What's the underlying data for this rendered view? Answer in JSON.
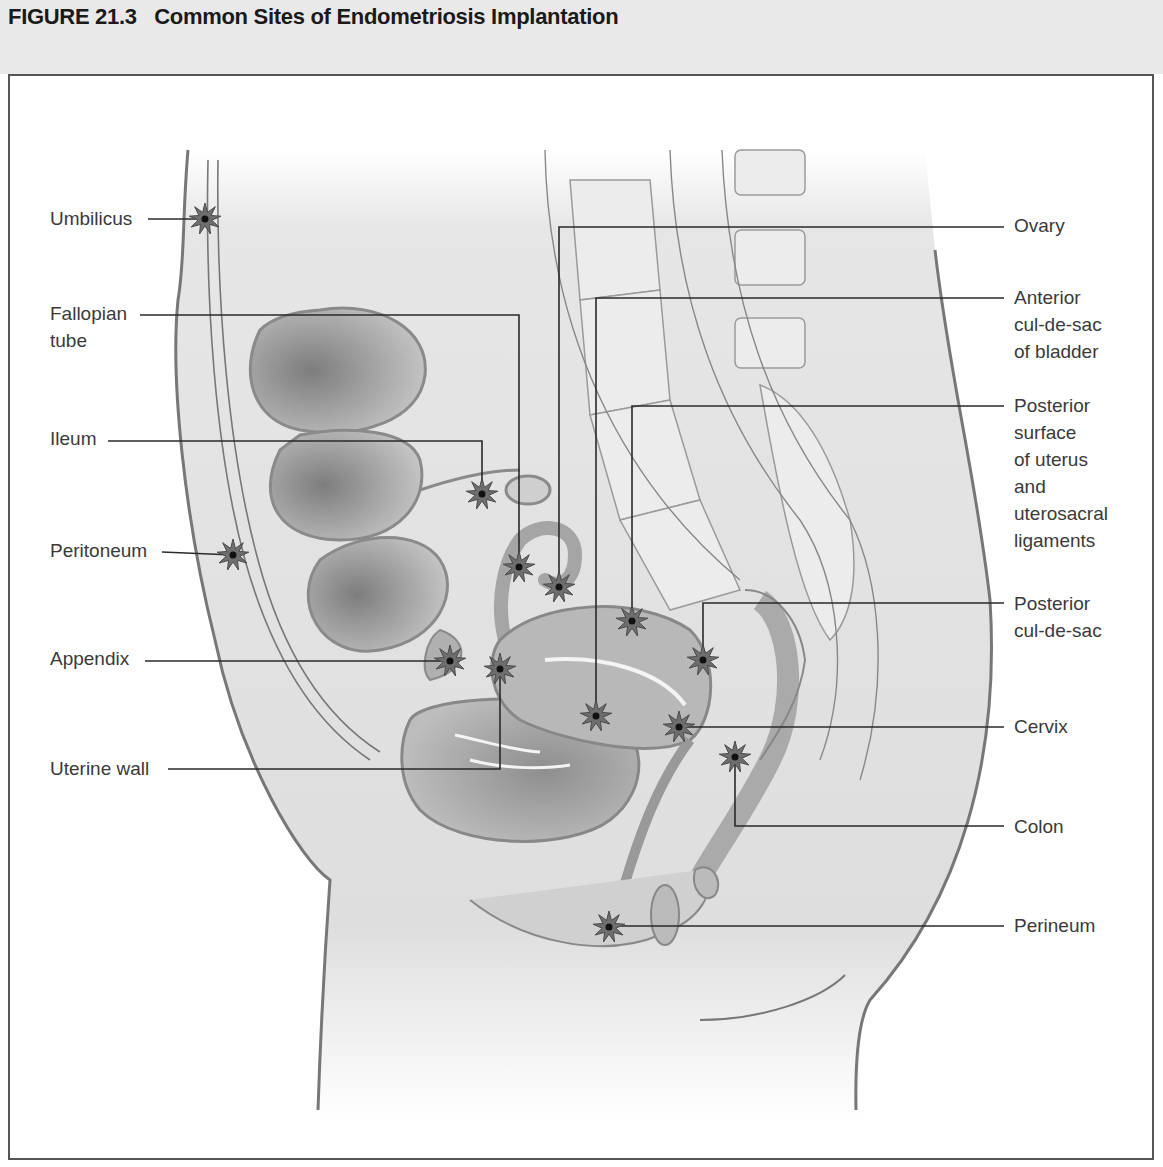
{
  "figure": {
    "number": "FIGURE 21.3",
    "title": "Common Sites of Endometriosis Implantation",
    "heading": "FIGURE 21.3   Common Sites of Endometriosis Implantation"
  },
  "colors": {
    "band": "#e9e9e9",
    "frame": "#555555",
    "leader": "#2a2a2a",
    "star_fill": "#6e6e6e",
    "star_dot": "#111111",
    "tissue": "#cfcfcf",
    "organ": "#a8a8a8",
    "outline": "#6a6a6a",
    "text": "#3a3a3a"
  },
  "labels": {
    "left": [
      {
        "id": "umbilicus",
        "text": "Umbilicus",
        "x": 50,
        "y": 205
      },
      {
        "id": "fallopian-tube",
        "text": "Fallopian\ntube",
        "x": 50,
        "y": 300
      },
      {
        "id": "ileum",
        "text": "Ileum",
        "x": 50,
        "y": 425
      },
      {
        "id": "peritoneum",
        "text": "Peritoneum",
        "x": 50,
        "y": 537
      },
      {
        "id": "appendix",
        "text": "Appendix",
        "x": 50,
        "y": 645
      },
      {
        "id": "uterine-wall",
        "text": "Uterine wall",
        "x": 50,
        "y": 755
      }
    ],
    "right": [
      {
        "id": "ovary",
        "text": "Ovary",
        "x": 1014,
        "y": 212
      },
      {
        "id": "anterior-cul-de-sac",
        "text": "Anterior\ncul-de-sac\nof bladder",
        "x": 1014,
        "y": 284
      },
      {
        "id": "posterior-surface-uterus",
        "text": "Posterior\nsurface\nof uterus\nand\nuterosacral\nligaments",
        "x": 1014,
        "y": 392
      },
      {
        "id": "posterior-cul-de-sac",
        "text": "Posterior\ncul-de-sac",
        "x": 1014,
        "y": 590
      },
      {
        "id": "cervix",
        "text": "Cervix",
        "x": 1014,
        "y": 713
      },
      {
        "id": "colon",
        "text": "Colon",
        "x": 1014,
        "y": 813
      },
      {
        "id": "perineum",
        "text": "Perineum",
        "x": 1014,
        "y": 912
      }
    ]
  },
  "implant_sites": [
    {
      "id": "umbilicus",
      "x": 205,
      "y": 219
    },
    {
      "id": "fallopian-tube",
      "x": 519,
      "y": 567
    },
    {
      "id": "ovary",
      "x": 559,
      "y": 587
    },
    {
      "id": "ileum",
      "x": 482,
      "y": 494
    },
    {
      "id": "peritoneum",
      "x": 233,
      "y": 555
    },
    {
      "id": "appendix",
      "x": 450,
      "y": 661
    },
    {
      "id": "uterine-wall",
      "x": 500,
      "y": 669
    },
    {
      "id": "anterior-cul-de-sac",
      "x": 596,
      "y": 716
    },
    {
      "id": "posterior-surface-uterus",
      "x": 632,
      "y": 621
    },
    {
      "id": "posterior-cul-de-sac",
      "x": 703,
      "y": 660
    },
    {
      "id": "cervix",
      "x": 679,
      "y": 727
    },
    {
      "id": "colon",
      "x": 735,
      "y": 757
    },
    {
      "id": "perineum",
      "x": 609,
      "y": 927
    }
  ],
  "leaders": [
    {
      "id": "umbilicus",
      "points": "148,219 205,219"
    },
    {
      "id": "fallopian-tube",
      "points": "140,315 519,315 519,567"
    },
    {
      "id": "ileum",
      "points": "108,441 482,441 482,494"
    },
    {
      "id": "peritoneum",
      "points": "162,552 233,555"
    },
    {
      "id": "appendix",
      "points": "145,661 450,661"
    },
    {
      "id": "uterine-wall",
      "points": "168,769 500,769 500,669"
    },
    {
      "id": "ovary",
      "points": "1004,227 559,227 559,587"
    },
    {
      "id": "anterior-cul-de-sac",
      "points": "1004,298 596,298 596,716"
    },
    {
      "id": "posterior-surface-uterus",
      "points": "1004,406 632,406 632,621"
    },
    {
      "id": "posterior-cul-de-sac",
      "points": "1004,603 703,603 703,660"
    },
    {
      "id": "cervix",
      "points": "1004,727 679,727"
    },
    {
      "id": "colon",
      "points": "1004,826 735,826 735,757"
    },
    {
      "id": "perineum",
      "points": "1004,926 609,926"
    }
  ]
}
